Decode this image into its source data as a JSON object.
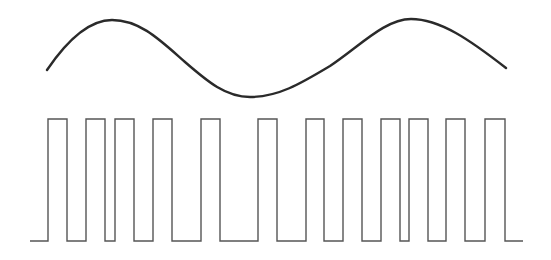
{
  "diagram": {
    "type": "pwm-modulation",
    "colors": {
      "background": "#ffffff",
      "sine_stroke": "#2a2a2a",
      "square_stroke": "#555555"
    },
    "sine_wave": {
      "path": "M47,70 C66,42 88,20 112,20 C140,20 160,40 185,62 C208,82 226,97 250,97 C278,97 300,84 330,66 C360,46 385,19 411,19 C440,19 470,40 506,68"
    },
    "square_wave": {
      "baseline_y": 241,
      "high_y": 119,
      "start_x": 30,
      "end_x": 523,
      "pulses": [
        [
          48,
          67
        ],
        [
          86,
          105
        ],
        [
          115,
          134
        ],
        [
          153,
          172
        ],
        [
          201,
          220
        ],
        [
          258,
          277
        ],
        [
          306,
          324
        ],
        [
          343,
          362
        ],
        [
          381,
          400
        ],
        [
          409,
          428
        ],
        [
          446,
          465
        ],
        [
          485,
          505
        ]
      ]
    }
  }
}
